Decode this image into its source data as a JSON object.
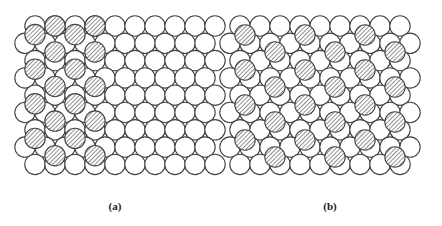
{
  "figure": {
    "colors": {
      "stroke": "#444444",
      "fill": "#ffffff",
      "hatch": "#555555"
    },
    "radius": 10.2,
    "panels": [
      {
        "id": "a",
        "caption": "(a)",
        "base": {
          "rows": 9,
          "y0": 26,
          "dy": 17.3,
          "even": {
            "x0": 35,
            "dx": 20,
            "count": 10
          },
          "odd": {
            "x0": 25,
            "dx": 20,
            "count": 10
          }
        },
        "hatched": {
          "note": "close-packed overlayer domain shifted half a row",
          "columns_x": [
            35,
            55,
            75,
            95
          ],
          "y_even_cols": [
            34.6,
            69.2,
            103.8,
            138.4
          ],
          "y_odd_cols": [
            26,
            51.9,
            86.5,
            121.1,
            155.7
          ],
          "pattern": "alternating"
        }
      },
      {
        "id": "b",
        "caption": "(b)",
        "base": {
          "rows": 9,
          "y0": 26,
          "dy": 17.3,
          "even": {
            "x0": 240,
            "dx": 20,
            "count": 9
          },
          "odd": {
            "x0": 230,
            "dx": 20,
            "count": 10
          }
        },
        "hatched": {
          "columns_x": [
            245,
            275,
            305,
            335,
            365,
            395
          ],
          "y_even_cols": [
            35,
            70,
            105,
            140
          ],
          "y_odd_cols": [
            52,
            87,
            122,
            157
          ],
          "pattern": "alternating"
        }
      }
    ]
  }
}
